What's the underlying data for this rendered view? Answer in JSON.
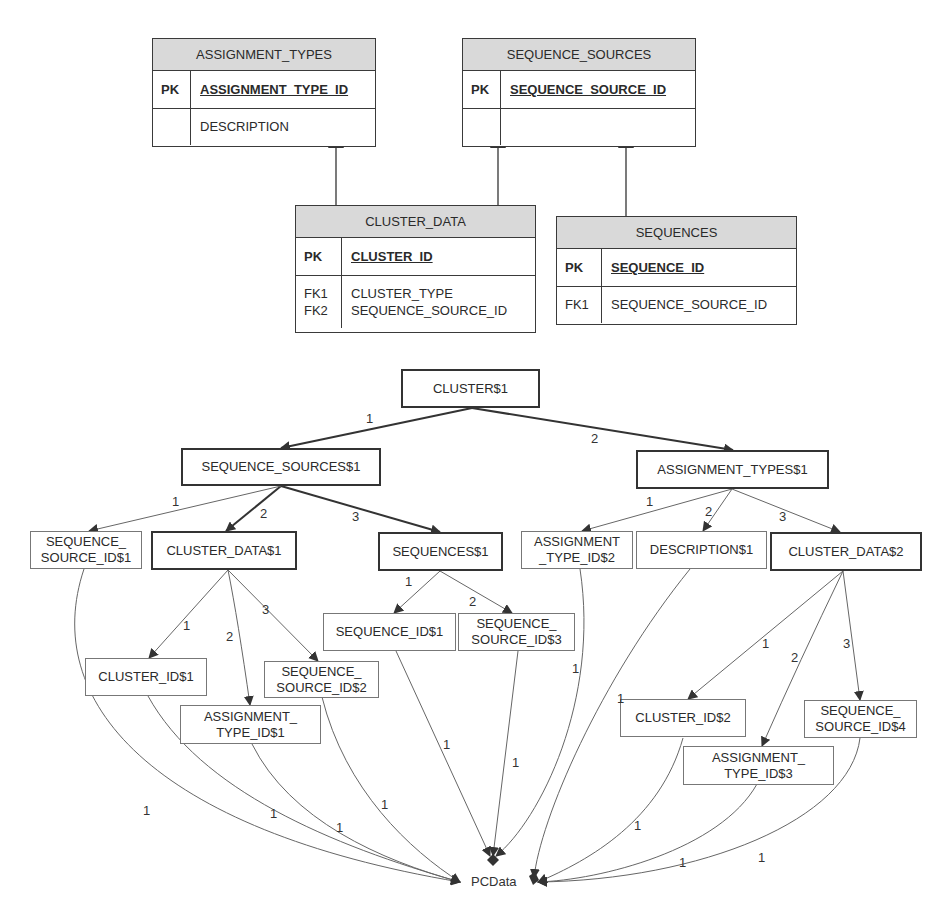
{
  "er_diagram": {
    "tables": [
      {
        "name": "ASSIGNMENT_TYPES",
        "pk_label": "PK",
        "pk_field": "ASSIGNMENT_TYPE_ID",
        "attrs": [
          {
            "key": "",
            "field": "DESCRIPTION"
          }
        ]
      },
      {
        "name": "SEQUENCE_SOURCES",
        "pk_label": "PK",
        "pk_field": "SEQUENCE_SOURCE_ID",
        "attrs": [
          {
            "key": "",
            "field": ""
          }
        ]
      },
      {
        "name": "CLUSTER_DATA",
        "pk_label": "PK",
        "pk_field": "CLUSTER_ID",
        "attrs": [
          {
            "key": "FK1\nFK2",
            "field": "CLUSTER_TYPE\nSEQUENCE_SOURCE_ID"
          }
        ]
      },
      {
        "name": "SEQUENCES",
        "pk_label": "PK",
        "pk_field": "SEQUENCE_ID",
        "attrs": [
          {
            "key": "FK1",
            "field": "SEQUENCE_SOURCE_ID"
          }
        ]
      }
    ],
    "relationships": [
      {
        "from": "CLUSTER_DATA",
        "to": "ASSIGNMENT_TYPES"
      },
      {
        "from": "CLUSTER_DATA",
        "to": "SEQUENCE_SOURCES"
      },
      {
        "from": "SEQUENCES",
        "to": "SEQUENCE_SOURCES"
      }
    ]
  },
  "tree_diagram": {
    "nodes": {
      "cluster1": "CLUSTER$1",
      "seq_sources1": "SEQUENCE_SOURCES$1",
      "assign_types1": "ASSIGNMENT_TYPES$1",
      "seq_source_id1_a": "SEQUENCE_",
      "seq_source_id1_b": "SOURCE_ID$1",
      "cluster_data1": "CLUSTER_DATA$1",
      "sequences1": "SEQUENCES$1",
      "assign_type_id2_a": "ASSIGNMENT",
      "assign_type_id2_b": "_TYPE_ID$2",
      "description1": "DESCRIPTION$1",
      "cluster_data2": "CLUSTER_DATA$2",
      "cluster_id1": "CLUSTER_ID$1",
      "assign_type_id1_a": "ASSIGNMENT_",
      "assign_type_id1_b": "TYPE_ID$1",
      "seq_source_id2_a": "SEQUENCE_",
      "seq_source_id2_b": "SOURCE_ID$2",
      "sequence_id1": "SEQUENCE_ID$1",
      "seq_source_id3_a": "SEQUENCE_",
      "seq_source_id3_b": "SOURCE_ID$3",
      "cluster_id2": "CLUSTER_ID$2",
      "assign_type_id3_a": "ASSIGNMENT_",
      "assign_type_id3_b": "TYPE_ID$3",
      "seq_source_id4_a": "SEQUENCE_",
      "seq_source_id4_b": "SOURCE_ID$4",
      "pcdata": "PCData"
    },
    "edge_labels": {
      "c1_ss1": "1",
      "c1_at1": "2",
      "ss1_ssid1": "1",
      "ss1_cd1": "2",
      "ss1_seq1": "3",
      "at1_atid2": "1",
      "at1_desc1": "2",
      "at1_cd2": "3",
      "cd1_cid1": "1",
      "cd1_atid1": "2",
      "cd1_ssid2": "3",
      "seq1_sid1": "1",
      "seq1_ssid3": "2",
      "cd2_cid2": "1",
      "cd2_atid3": "2",
      "cd2_ssid4": "3",
      "pc": "1"
    }
  }
}
